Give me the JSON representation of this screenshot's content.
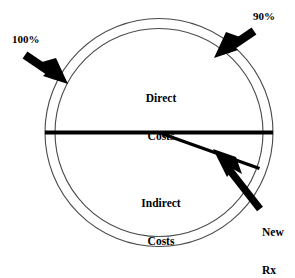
{
  "diagram": {
    "colors": {
      "stroke": "#000000",
      "thin_stroke": "#3a3a3a",
      "background": "#ffffff",
      "text": "#000000"
    },
    "geometry": {
      "center_x": 159,
      "center_y": 132,
      "outer_radius": 114,
      "inner_radius": 104,
      "divider_line_y": 132
    },
    "segments": [
      {
        "name": "direct-costs",
        "label_line1": "Direct",
        "label_line2": "Costs"
      },
      {
        "name": "indirect-costs",
        "label_line1": "Indirect",
        "label_line2": "Costs"
      }
    ],
    "callouts": [
      {
        "name": "outer-ring-callout",
        "text": "100%",
        "arrow_from": [
          26,
          56
        ],
        "arrow_to": [
          64,
          82
        ],
        "describes": "outer-circle"
      },
      {
        "name": "inner-ring-callout",
        "text": "90%",
        "arrow_from": [
          253,
          32
        ],
        "arrow_to": [
          216,
          56
        ],
        "describes": "inner-circle"
      },
      {
        "name": "new-rx-callout",
        "text_line1": "New",
        "text_line2": "Rx",
        "arrow_from": [
          259,
          207
        ],
        "arrow_to": [
          215,
          151
        ],
        "describes": "new-rx-wedge"
      }
    ],
    "wedge": {
      "name": "new-rx-wedge",
      "apex": [
        160,
        133
      ],
      "end": [
        259,
        168
      ]
    }
  }
}
